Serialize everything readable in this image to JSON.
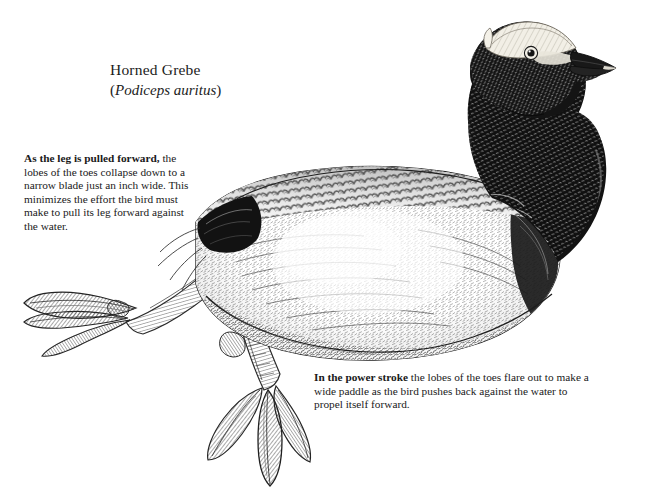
{
  "figure": {
    "kind": "scientific-pen-and-ink-illustration",
    "background_color": "#ffffff",
    "ink_color": "#1a1a1a"
  },
  "title": {
    "common_name": "Horned Grebe",
    "scientific_name": "Podiceps auritus",
    "scientific_name_open_paren": "(",
    "scientific_name_close_paren": ")"
  },
  "annotations": [
    {
      "id": "recovery-stroke",
      "lead_bold": "As the leg is pulled forward,",
      "body": " the lobes of the toes collapse down to a narrow blade just an inch wide. This minimizes the effort the bird must make to pull its leg forward against the water.",
      "points_to": "forward-extended-leg-with-collapsed-lobes"
    },
    {
      "id": "power-stroke",
      "lead_bold": "In the power stroke",
      "body": " the lobes of the toes flare out to make a wide paddle as the bird pushes back against the water to propel itself forward.",
      "points_to": "lower-leg-with-flared-lobed-toes"
    }
  ],
  "illustration_parts": [
    {
      "name": "head",
      "note": "dark crown and cheek with pale buff horn tuft above eye"
    },
    {
      "name": "eye",
      "note": "pale iris with dark pupil"
    },
    {
      "name": "bill",
      "note": "short sharply pointed dagger bill, dark with pale tip"
    },
    {
      "name": "neck",
      "note": "solid dark plumage grading to scalloped feathers at base"
    },
    {
      "name": "back",
      "note": "scalloped mid-grey feather scales along upper back"
    },
    {
      "name": "flank",
      "note": "light mottled plumage with fine hatching"
    },
    {
      "name": "rump-dark-patch",
      "note": "strong black wedge at rear of back near tail"
    },
    {
      "name": "rear-flank-dark-patch",
      "note": "dark shading at right rear of body"
    },
    {
      "name": "waterline",
      "note": "body floats low, belly line suggests water surface"
    },
    {
      "name": "recovery-leg",
      "note": "leg extended forward-left, toe lobes folded to a narrow blade, fine diagonal hatching"
    },
    {
      "name": "power-leg",
      "note": "leg below body with three broad flared lobed toes"
    }
  ]
}
